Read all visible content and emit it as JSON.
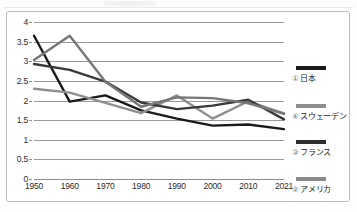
{
  "chart_data": {
    "type": "line",
    "title": "",
    "subtitle": "",
    "xlabel": "",
    "ylabel": "",
    "x": [
      "1950",
      "1960",
      "1970",
      "1980",
      "1990",
      "2000",
      "2010",
      "2021"
    ],
    "xtick_labels": [
      "1950",
      "1960",
      "1970",
      "1980",
      "1990",
      "2000",
      "2010",
      "2021"
    ],
    "ytick_labels": [
      "0",
      "0.5",
      "1",
      "1.5",
      "2",
      "2.5",
      "3",
      "3.5",
      "4"
    ],
    "ylim": [
      0,
      4
    ],
    "ytick_step": 0.5,
    "grid": true,
    "legend_position": "right",
    "series": [
      {
        "name": "日本",
        "marker_number": "①",
        "color": "#1a1a1a",
        "values": [
          3.65,
          1.97,
          2.13,
          1.75,
          1.54,
          1.36,
          1.39,
          1.27
        ]
      },
      {
        "name": "スウェーデン",
        "marker_number": "④",
        "color": "#8f8f8f",
        "values": [
          2.3,
          2.2,
          1.94,
          1.68,
          2.13,
          1.54,
          1.98,
          1.67
        ]
      },
      {
        "name": "フランス",
        "marker_number": "③",
        "color": "#3a3a3a",
        "values": [
          2.93,
          2.78,
          2.48,
          1.95,
          1.78,
          1.87,
          2.02,
          1.52
        ]
      },
      {
        "name": "アメリカ",
        "marker_number": "②",
        "color": "#767676",
        "values": [
          3.03,
          3.65,
          2.48,
          1.84,
          2.08,
          2.06,
          1.93,
          1.66
        ]
      }
    ]
  },
  "legend": {
    "items": [
      {
        "number": "①",
        "label": "日本",
        "color": "#1a1a1a"
      },
      {
        "number": "④",
        "label": "スウェーデン",
        "color": "#8f8f8f"
      },
      {
        "number": "③",
        "label": "フランス",
        "color": "#2e2e2e"
      },
      {
        "number": "②",
        "label": "アメリカ",
        "color": "#8a8a8a"
      }
    ]
  }
}
